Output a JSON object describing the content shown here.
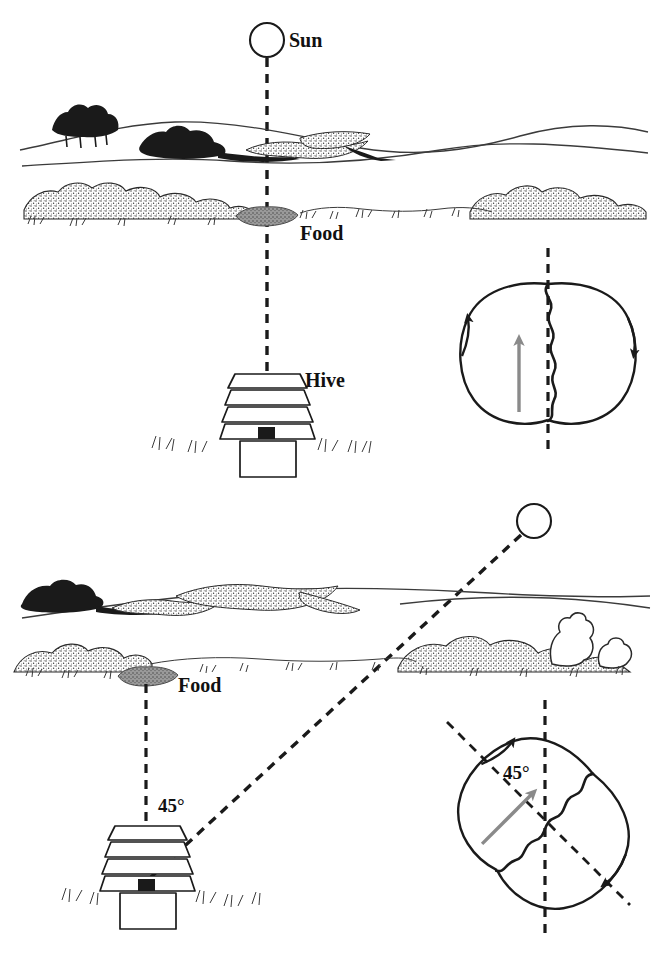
{
  "figure": {
    "ink_color": "#1a1a1a",
    "waggle_arrow_color": "#8a8a8a",
    "background_color": "#ffffff",
    "food_patch_color": "#8c8c8c"
  },
  "panels": [
    {
      "id": "panel-top",
      "name": "food-in-line-with-sun",
      "labels": {
        "sun": "Sun",
        "food": "Food",
        "hive": "Hive"
      },
      "sun": {
        "cx": 267,
        "cy": 40,
        "r": 17,
        "label_x": 289,
        "label_y": 47
      },
      "food": {
        "x": 267,
        "y": 217,
        "label_x": 300,
        "label_y": 240
      },
      "hive": {
        "x": 243,
        "y": 372,
        "label_x": 305,
        "label_y": 387
      },
      "sight_line": {
        "x1": 267,
        "y1": 57,
        "x2": 267,
        "y2": 430,
        "dashed": true
      },
      "dance": {
        "id": "dance-top",
        "name": "vertical-waggle-dance",
        "cx": 548,
        "cy": 352,
        "rx": 82,
        "ry": 68,
        "waggle_angle_deg": 0,
        "gravity_line": "vertical-dashed",
        "loop_direction": "figure-eight",
        "angle_label": null
      }
    },
    {
      "id": "panel-bottom",
      "name": "food-45-degrees-from-sun",
      "labels": {
        "food": "Food",
        "angle": "45°"
      },
      "sun": {
        "cx": 534,
        "cy": 521,
        "r": 17
      },
      "food": {
        "x": 146,
        "y": 678,
        "label_x": 178,
        "label_y": 692
      },
      "hive": {
        "x": 122,
        "y": 824,
        "entrance_x": 147,
        "entrance_y": 880
      },
      "food_line": {
        "x1": 146,
        "y1": 683,
        "x2": 146,
        "y2": 880,
        "dashed": true
      },
      "sun_line": {
        "x1": 521,
        "y1": 536,
        "x2": 147,
        "y2": 880,
        "dashed": true
      },
      "angle_label": {
        "text": "45°",
        "x": 161,
        "y": 812
      },
      "dance": {
        "id": "dance-bottom",
        "name": "tilted-waggle-dance",
        "cx": 545,
        "cy": 822,
        "rx": 82,
        "ry": 68,
        "waggle_angle_deg": 45,
        "gravity_line": "vertical-dashed",
        "direction_line": "diagonal-dashed-45deg",
        "angle_label": {
          "text": "45°",
          "x": 503,
          "y": 778
        }
      }
    }
  ]
}
